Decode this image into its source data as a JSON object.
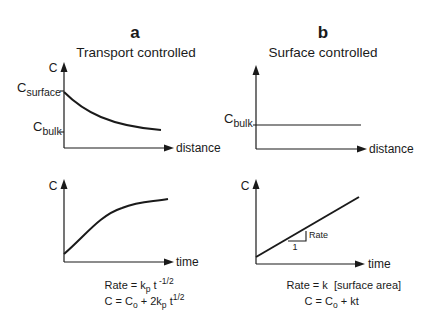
{
  "panels": [
    {
      "letter": "a",
      "title": "Transport controlled",
      "top_plot": {
        "y_label": "C",
        "x_label": "distance",
        "levels": [
          {
            "main": "C",
            "sub": "surface"
          },
          {
            "main": "C",
            "sub": "bulk"
          }
        ],
        "curve": "exponential decay from C_surface toward C_bulk"
      },
      "bottom_plot": {
        "y_label": "C",
        "x_label": "time",
        "curve": "concave increasing (square-root-like)"
      },
      "formulas": [
        {
          "parts": [
            {
              "t": "Rate = k"
            },
            {
              "t": "p",
              "sub": true
            },
            {
              "t": " t"
            },
            {
              "t": " -1/2",
              "sup": true
            }
          ]
        },
        {
          "parts": [
            {
              "t": "C = C"
            },
            {
              "t": "o",
              "sub": true
            },
            {
              "t": " + 2k"
            },
            {
              "t": "p",
              "sub": true
            },
            {
              "t": " t"
            },
            {
              "t": "1/2",
              "sup": true
            }
          ]
        }
      ]
    },
    {
      "letter": "b",
      "title": "Surface controlled",
      "top_plot": {
        "y_label": "",
        "x_label": "distance",
        "levels": [
          {
            "main": "C",
            "sub": "bulk"
          }
        ],
        "curve": "constant at C_bulk"
      },
      "bottom_plot": {
        "y_label": "C",
        "x_label": "time",
        "curve": "linear increase",
        "slope_triangle": {
          "run": "1",
          "rise": "Rate"
        }
      },
      "formulas": [
        {
          "parts": [
            {
              "t": "Rate = k  [surface area]"
            }
          ]
        },
        {
          "parts": [
            {
              "t": "C = C"
            },
            {
              "t": "o",
              "sub": true
            },
            {
              "t": " + kt"
            }
          ]
        }
      ]
    }
  ]
}
